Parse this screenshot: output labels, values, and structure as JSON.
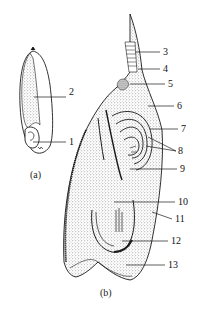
{
  "figure": {
    "panel_a": {
      "caption": "(a)",
      "labels": [
        {
          "num": "1",
          "x": 69,
          "y": 137
        },
        {
          "num": "2",
          "x": 69,
          "y": 92
        }
      ]
    },
    "panel_b": {
      "caption": "(b)",
      "labels": [
        {
          "num": "3",
          "x": 163,
          "y": 47
        },
        {
          "num": "4",
          "x": 163,
          "y": 64
        },
        {
          "num": "5",
          "x": 168,
          "y": 79
        },
        {
          "num": "6",
          "x": 177,
          "y": 101
        },
        {
          "num": "7",
          "x": 181,
          "y": 124
        },
        {
          "num": "8",
          "x": 178,
          "y": 146
        },
        {
          "num": "9",
          "x": 180,
          "y": 164
        },
        {
          "num": "10",
          "x": 178,
          "y": 197
        },
        {
          "num": "11",
          "x": 175,
          "y": 214
        },
        {
          "num": "12",
          "x": 171,
          "y": 236
        },
        {
          "num": "13",
          "x": 168,
          "y": 260
        }
      ]
    },
    "colors": {
      "ink": "#1a1a1a",
      "stipple": "#666666",
      "paper": "#ffffff"
    }
  }
}
